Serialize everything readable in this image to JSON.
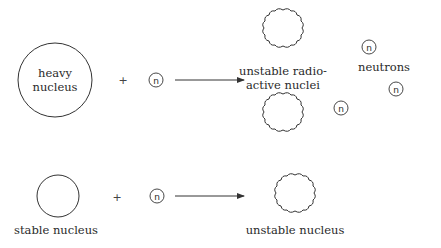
{
  "diagram": {
    "reaction_fission": {
      "reactant_nucleus": {
        "label_line1": "heavy",
        "label_line2": "nucleus"
      },
      "plus": "+",
      "neutron": "n",
      "products": {
        "nuclei_label_line1": "unstable radio-",
        "nuclei_label_line2": "active nuclei",
        "neutrons_label": "neutrons",
        "neutron_symbols": [
          "n",
          "n",
          "n"
        ]
      }
    },
    "reaction_capture": {
      "reactant_nucleus": {
        "label": "stable nucleus"
      },
      "plus": "+",
      "neutron": "n",
      "product": {
        "label": "unstable nucleus"
      }
    }
  }
}
